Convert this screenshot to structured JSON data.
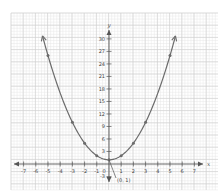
{
  "chart_data": {
    "type": "line",
    "title": "",
    "function": "y = x^2 + 1",
    "xlabel": "x",
    "ylabel": "y",
    "xlim": [
      -7,
      7
    ],
    "ylim": [
      -3,
      30
    ],
    "x_ticks": [
      -7,
      -6,
      -5,
      -4,
      -3,
      -2,
      -1,
      0,
      1,
      2,
      3,
      4,
      5,
      6,
      7
    ],
    "x_tick_labels": [
      "-7",
      "-6",
      "-5",
      "-4",
      "-3",
      "-2",
      "-1",
      "0",
      "1",
      "2",
      "3",
      "4",
      "5",
      "6",
      "7"
    ],
    "y_ticks": [
      -3,
      3,
      6,
      9,
      12,
      15,
      18,
      21,
      24,
      27,
      30
    ],
    "y_tick_labels": [
      "-3",
      "3",
      "6",
      "9",
      "12",
      "15",
      "18",
      "21",
      "24",
      "27",
      "30"
    ],
    "grid": true,
    "series": [
      {
        "name": "parabola",
        "points": [
          {
            "x": -5,
            "y": 26
          },
          {
            "x": -3,
            "y": 10
          },
          {
            "x": -2,
            "y": 5
          },
          {
            "x": -1,
            "y": 2
          },
          {
            "x": 0,
            "y": 1
          },
          {
            "x": 1,
            "y": 2
          },
          {
            "x": 2,
            "y": 5
          },
          {
            "x": 3,
            "y": 10
          },
          {
            "x": 5,
            "y": 26
          }
        ]
      }
    ],
    "annotations": [
      {
        "text": "(0, 1)",
        "x": 0,
        "y": 1
      }
    ],
    "colors": {
      "curve": "#6b6b6b",
      "axes": "#555555",
      "grid_major": "#cfcfcf",
      "grid_minor": "#e6e6e6",
      "text": "#444444"
    }
  }
}
